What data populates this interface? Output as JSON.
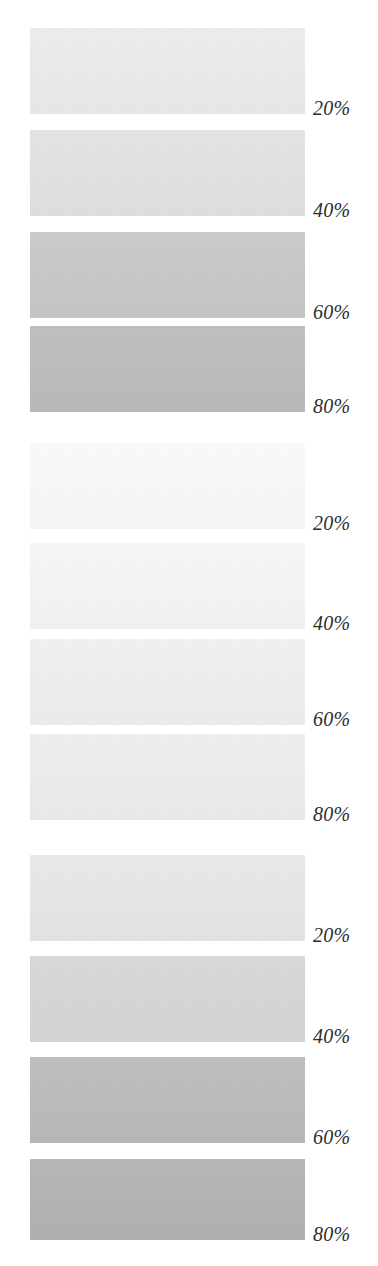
{
  "page": {
    "background_color": "#ffffff",
    "label_color": "#2e2e2e",
    "width": 378,
    "height": 1266
  },
  "chart_data": {
    "type": "table",
    "xlabel": "",
    "ylabel": "",
    "categories": [
      "20%",
      "40%",
      "60%",
      "80%"
    ],
    "series": [
      {
        "name": "Group 1",
        "values": [
          20,
          40,
          60,
          80
        ]
      },
      {
        "name": "Group 2",
        "values": [
          20,
          40,
          60,
          80
        ]
      },
      {
        "name": "Group 3",
        "values": [
          20,
          40,
          60,
          80
        ]
      }
    ],
    "swatch_colors": [
      [
        "#ededed",
        "#e4e4e4",
        "#c9c9c9",
        "#bdbdbd"
      ],
      [
        "#fbfbfb",
        "#f7f7f7",
        "#f1f1f1",
        "#efefef"
      ],
      [
        "#e9e9e9",
        "#d8d8d8",
        "#bcbcbc",
        "#b4b4b4"
      ]
    ]
  },
  "groups": [
    {
      "name": "tint-group-1",
      "top": 28,
      "rows": [
        {
          "label": "20%",
          "color": "#ededed",
          "top": 0,
          "height": 86
        },
        {
          "label": "40%",
          "color": "#e4e4e4",
          "top": 102,
          "height": 86
        },
        {
          "label": "60%",
          "color": "#c9c9c9",
          "top": 204,
          "height": 86
        },
        {
          "label": "80%",
          "color": "#bdbdbd",
          "top": 298,
          "height": 86
        }
      ]
    },
    {
      "name": "tint-group-2",
      "top": 443,
      "rows": [
        {
          "label": "20%",
          "color": "#fbfbfb",
          "top": 0,
          "height": 86
        },
        {
          "label": "40%",
          "color": "#f7f7f7",
          "top": 100,
          "height": 86
        },
        {
          "label": "60%",
          "color": "#f1f1f1",
          "top": 196,
          "height": 86
        },
        {
          "label": "80%",
          "color": "#efefef",
          "top": 291,
          "height": 86
        }
      ]
    },
    {
      "name": "tint-group-3",
      "top": 855,
      "rows": [
        {
          "label": "20%",
          "color": "#e9e9e9",
          "top": 0,
          "height": 86
        },
        {
          "label": "40%",
          "color": "#d8d8d8",
          "top": 101,
          "height": 86
        },
        {
          "label": "60%",
          "color": "#bcbcbc",
          "top": 202,
          "height": 86
        },
        {
          "label": "80%",
          "color": "#b4b4b4",
          "top": 304,
          "height": 81
        }
      ]
    }
  ]
}
